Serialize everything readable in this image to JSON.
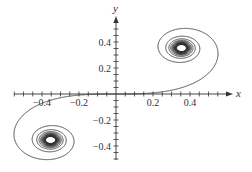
{
  "chart_data": {
    "type": "line",
    "title": "",
    "xlabel": "x",
    "ylabel": "y",
    "xlim": [
      -0.55,
      0.58
    ],
    "ylim": [
      -0.5,
      0.6
    ],
    "x_ticks": [
      -0.4,
      -0.2,
      0.2,
      0.4
    ],
    "x_tick_labels": [
      "−0.4",
      "−0.2",
      "0.2",
      "0.4"
    ],
    "y_ticks": [
      -0.4,
      -0.2,
      0.2,
      0.4
    ],
    "y_tick_labels": [
      "−0.4",
      "−0.2",
      "0.2",
      "0.4"
    ],
    "minor_tick_step": 0.05,
    "grid": false,
    "legend": null,
    "series": [
      {
        "name": "Cornu spiral",
        "parametric": true,
        "limit_points": [
          [
            0.354,
            0.354
          ],
          [
            -0.354,
            -0.354
          ]
        ],
        "color": "#333333"
      }
    ]
  },
  "axes": {
    "x_label": "x",
    "y_label": "y"
  }
}
